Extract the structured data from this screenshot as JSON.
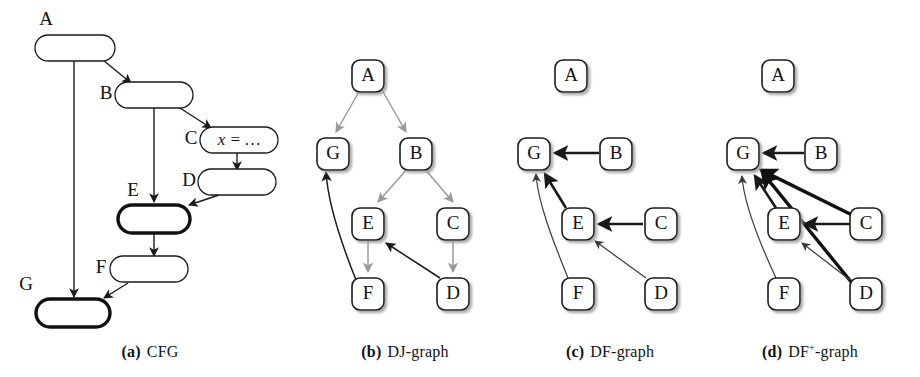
{
  "figure": {
    "background": "#ffffff",
    "ink": "#111111",
    "gray_edge_color": "#9a9a9a",
    "dark_edge_color": "#1a1a1a",
    "shadow_color": "#b4b4b4",
    "width": 920,
    "height": 377
  },
  "panels": [
    {
      "id": "cfg",
      "caption_tag": "(a)",
      "caption_text": "CFG",
      "node_shape": "rounded-rectangle",
      "nodes": [
        {
          "id": "A",
          "label": "A",
          "bold": false,
          "code": ""
        },
        {
          "id": "B",
          "label": "B",
          "bold": false,
          "code": ""
        },
        {
          "id": "C",
          "label": "C",
          "bold": false,
          "code": "x = …"
        },
        {
          "id": "D",
          "label": "D",
          "bold": false,
          "code": ""
        },
        {
          "id": "E",
          "label": "E",
          "bold": true,
          "code": ""
        },
        {
          "id": "F",
          "label": "F",
          "bold": false,
          "code": ""
        },
        {
          "id": "G",
          "label": "G",
          "bold": true,
          "code": ""
        }
      ],
      "edges": [
        {
          "from": "A",
          "to": "B",
          "style": "dark"
        },
        {
          "from": "A",
          "to": "G",
          "style": "dark"
        },
        {
          "from": "B",
          "to": "C",
          "style": "dark"
        },
        {
          "from": "B",
          "to": "E",
          "style": "dark"
        },
        {
          "from": "C",
          "to": "D",
          "style": "dark"
        },
        {
          "from": "D",
          "to": "E",
          "style": "dark"
        },
        {
          "from": "E",
          "to": "F",
          "style": "dark"
        },
        {
          "from": "F",
          "to": "G",
          "style": "dark"
        }
      ]
    },
    {
      "id": "dj-graph",
      "caption_tag": "(b)",
      "caption_text": "DJ-graph",
      "node_shape": "rounded-square",
      "nodes": [
        {
          "id": "A",
          "label": "A"
        },
        {
          "id": "G",
          "label": "G"
        },
        {
          "id": "B",
          "label": "B"
        },
        {
          "id": "E",
          "label": "E"
        },
        {
          "id": "C",
          "label": "C"
        },
        {
          "id": "F",
          "label": "F"
        },
        {
          "id": "D",
          "label": "D"
        }
      ],
      "edges": [
        {
          "from": "A",
          "to": "G",
          "style": "gray",
          "kind": "D-edge"
        },
        {
          "from": "A",
          "to": "B",
          "style": "gray",
          "kind": "D-edge"
        },
        {
          "from": "B",
          "to": "E",
          "style": "gray",
          "kind": "D-edge"
        },
        {
          "from": "B",
          "to": "C",
          "style": "gray",
          "kind": "D-edge"
        },
        {
          "from": "E",
          "to": "F",
          "style": "gray",
          "kind": "D-edge"
        },
        {
          "from": "C",
          "to": "D",
          "style": "gray",
          "kind": "D-edge"
        },
        {
          "from": "F",
          "to": "G",
          "style": "dark",
          "kind": "J-edge"
        },
        {
          "from": "D",
          "to": "E",
          "style": "dark",
          "kind": "J-edge"
        }
      ]
    },
    {
      "id": "df-graph",
      "caption_tag": "(c)",
      "caption_text": "DF-graph",
      "node_shape": "rounded-square",
      "nodes": [
        {
          "id": "A",
          "label": "A"
        },
        {
          "id": "G",
          "label": "G"
        },
        {
          "id": "B",
          "label": "B"
        },
        {
          "id": "E",
          "label": "E"
        },
        {
          "id": "C",
          "label": "C"
        },
        {
          "id": "F",
          "label": "F"
        },
        {
          "id": "D",
          "label": "D"
        }
      ],
      "edges": [
        {
          "from": "B",
          "to": "G",
          "style": "dark-thick"
        },
        {
          "from": "E",
          "to": "G",
          "style": "dark-thick"
        },
        {
          "from": "C",
          "to": "E",
          "style": "dark-thick"
        },
        {
          "from": "F",
          "to": "G",
          "style": "thin"
        },
        {
          "from": "D",
          "to": "E",
          "style": "thin"
        }
      ]
    },
    {
      "id": "df-plus-graph",
      "caption_tag": "(d)",
      "caption_text": "DF",
      "caption_sup": "+",
      "caption_tail": "-graph",
      "node_shape": "rounded-square",
      "nodes": [
        {
          "id": "A",
          "label": "A"
        },
        {
          "id": "G",
          "label": "G"
        },
        {
          "id": "B",
          "label": "B"
        },
        {
          "id": "E",
          "label": "E"
        },
        {
          "id": "C",
          "label": "C"
        },
        {
          "id": "F",
          "label": "F"
        },
        {
          "id": "D",
          "label": "D"
        }
      ],
      "edges": [
        {
          "from": "B",
          "to": "G",
          "style": "dark-thick"
        },
        {
          "from": "E",
          "to": "G",
          "style": "dark-thick"
        },
        {
          "from": "C",
          "to": "E",
          "style": "dark-thick"
        },
        {
          "from": "C",
          "to": "G",
          "style": "dark-extra-thick"
        },
        {
          "from": "D",
          "to": "G",
          "style": "dark-extra-thick"
        },
        {
          "from": "D",
          "to": "E",
          "style": "thin"
        },
        {
          "from": "F",
          "to": "G",
          "style": "thin"
        }
      ]
    }
  ]
}
